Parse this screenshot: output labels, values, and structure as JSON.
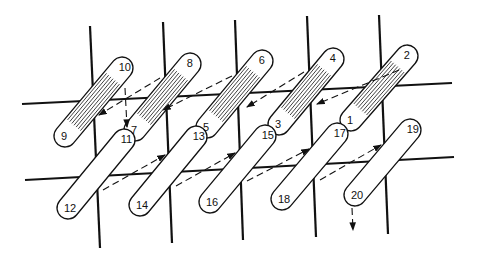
{
  "diagram": {
    "type": "coil-winding-sequence",
    "colors": {
      "line": "#111111",
      "background": "#ffffff"
    },
    "vertical_lines": [
      {
        "x1": 90,
        "y1": 26,
        "x2": 100,
        "y2": 248
      },
      {
        "x1": 163,
        "y1": 22,
        "x2": 172,
        "y2": 243
      },
      {
        "x1": 235,
        "y1": 20,
        "x2": 243,
        "y2": 240
      },
      {
        "x1": 307,
        "y1": 16,
        "x2": 316,
        "y2": 237
      },
      {
        "x1": 379,
        "y1": 15,
        "x2": 388,
        "y2": 234
      }
    ],
    "horizontal_lines": [
      {
        "x1": 22,
        "y1": 104,
        "x2": 452,
        "y2": 83
      },
      {
        "x1": 25,
        "y1": 180,
        "x2": 454,
        "y2": 157
      }
    ],
    "upper_row_loops": [
      {
        "top_label": "10",
        "bottom_label": "9",
        "top": [
          122,
          68
        ],
        "bottom": [
          65,
          136
        ],
        "hatched": true
      },
      {
        "top_label": "8",
        "bottom_label": "7",
        "top": [
          190,
          64
        ],
        "bottom": [
          135,
          130
        ],
        "hatched": true
      },
      {
        "top_label": "6",
        "bottom_label": "5",
        "top": [
          262,
          61
        ],
        "bottom": [
          207,
          127
        ],
        "hatched": true
      },
      {
        "top_label": "4",
        "bottom_label": "3",
        "top": [
          333,
          59
        ],
        "bottom": [
          279,
          124
        ],
        "hatched": true
      },
      {
        "top_label": "2",
        "bottom_label": "1",
        "top": [
          407,
          56
        ],
        "bottom": [
          351,
          120
        ],
        "hatched": true
      }
    ],
    "lower_row_loops": [
      {
        "top_label": "11",
        "bottom_label": "12",
        "top": [
          124,
          140
        ],
        "bottom": [
          68,
          208
        ],
        "hatched": false
      },
      {
        "top_label": "13",
        "bottom_label": "14",
        "top": [
          196,
          137
        ],
        "bottom": [
          140,
          205
        ],
        "hatched": false
      },
      {
        "top_label": "15",
        "bottom_label": "16",
        "top": [
          265,
          136
        ],
        "bottom": [
          210,
          202
        ],
        "hatched": false
      },
      {
        "top_label": "17",
        "bottom_label": "18",
        "top": [
          337,
          134
        ],
        "bottom": [
          282,
          199
        ],
        "hatched": false
      },
      {
        "top_label": "19",
        "bottom_label": "20",
        "top": [
          410,
          130
        ],
        "bottom": [
          355,
          195
        ],
        "hatched": false
      }
    ],
    "upper_arrows": [
      {
        "x1": 399,
        "y1": 70,
        "x2": 317,
        "y2": 104
      },
      {
        "x1": 304,
        "y1": 72,
        "x2": 247,
        "y2": 107
      },
      {
        "x1": 232,
        "y1": 76,
        "x2": 163,
        "y2": 110
      },
      {
        "x1": 160,
        "y1": 78,
        "x2": 99,
        "y2": 115
      }
    ],
    "lower_arrows": [
      {
        "x1": 103,
        "y1": 190,
        "x2": 165,
        "y2": 155
      },
      {
        "x1": 176,
        "y1": 186,
        "x2": 235,
        "y2": 153
      },
      {
        "x1": 247,
        "y1": 181,
        "x2": 309,
        "y2": 149
      },
      {
        "x1": 320,
        "y1": 180,
        "x2": 381,
        "y2": 145
      }
    ],
    "vertical_arrows": [
      {
        "from_label": "10",
        "x1": 125,
        "y1": 88,
        "x2": 127,
        "y2": 127
      },
      {
        "from_label": "20",
        "x1": 352,
        "y1": 208,
        "x2": 353,
        "y2": 230
      }
    ]
  }
}
